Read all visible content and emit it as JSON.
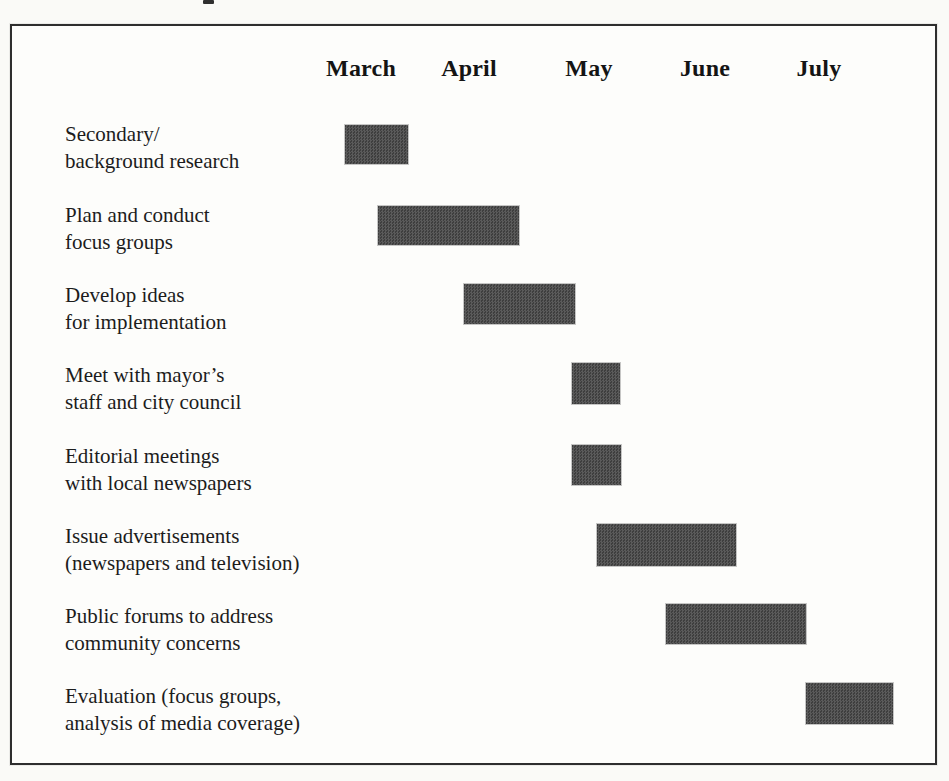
{
  "figure": {
    "background": "#fafaf7",
    "frame": {
      "left": 10,
      "top": 24,
      "width": 927,
      "height": 741,
      "border_color": "#2e2e2e",
      "fill": "#fdfdfb"
    },
    "bar_fill": "#4c4c4c",
    "scan_artifact": {
      "left": 203,
      "top": 0
    }
  },
  "chart_data": {
    "type": "gantt",
    "title": "",
    "xlabel": "",
    "ylabel": "",
    "grid": false,
    "legend": "none",
    "axis_position": "top",
    "month_scale_note": "month numbers: March=3, April=4, May=5, June=6, July=7; fractional = position within month",
    "xlim_months": [
      2.5,
      7.9
    ],
    "months": [
      {
        "label": "March",
        "month_number": 3,
        "center_px": 349
      },
      {
        "label": "April",
        "month_number": 4,
        "center_px": 457
      },
      {
        "label": "May",
        "month_number": 5,
        "center_px": 577
      },
      {
        "label": "June",
        "month_number": 6,
        "center_px": 693
      },
      {
        "label": "July",
        "month_number": 7,
        "center_px": 807
      }
    ],
    "header_top_px": 27,
    "label_left_px": 53,
    "tasks": [
      {
        "id": "secondary-background-research",
        "lines": [
          "Secondary/",
          "background research"
        ],
        "start_month": 2.85,
        "end_month": 3.45,
        "label_top_px": 95,
        "bar_px": {
          "left": 333,
          "top": 99,
          "width": 63,
          "height": 39
        }
      },
      {
        "id": "plan-conduct-focus-groups",
        "lines": [
          "Plan and conduct",
          "focus groups"
        ],
        "start_month": 3.15,
        "end_month": 4.4,
        "label_top_px": 176,
        "bar_px": {
          "left": 366,
          "top": 180,
          "width": 141,
          "height": 39
        }
      },
      {
        "id": "develop-ideas-implementation",
        "lines": [
          "Develop ideas",
          "for implementation"
        ],
        "start_month": 3.95,
        "end_month": 4.9,
        "label_top_px": 256,
        "bar_px": {
          "left": 452,
          "top": 258,
          "width": 111,
          "height": 40
        }
      },
      {
        "id": "meet-mayors-staff-city-council",
        "lines": [
          "Meet with mayor’s",
          "staff and city council"
        ],
        "start_month": 4.85,
        "end_month": 5.25,
        "label_top_px": 336,
        "bar_px": {
          "left": 560,
          "top": 337,
          "width": 48,
          "height": 41
        }
      },
      {
        "id": "editorial-meetings-local-newspapers",
        "lines": [
          "Editorial meetings",
          "with local newspapers"
        ],
        "start_month": 4.85,
        "end_month": 5.3,
        "label_top_px": 417,
        "bar_px": {
          "left": 560,
          "top": 419,
          "width": 49,
          "height": 40
        }
      },
      {
        "id": "issue-advertisements",
        "lines": [
          "Issue advertisements",
          "(newspapers and television)"
        ],
        "start_month": 5.05,
        "end_month": 6.25,
        "label_top_px": 497,
        "bar_px": {
          "left": 585,
          "top": 498,
          "width": 139,
          "height": 42
        }
      },
      {
        "id": "public-forums-community-concerns",
        "lines": [
          "Public forums to address",
          "community concerns"
        ],
        "start_month": 5.65,
        "end_month": 6.9,
        "label_top_px": 577,
        "bar_px": {
          "left": 654,
          "top": 578,
          "width": 140,
          "height": 40
        }
      },
      {
        "id": "evaluation-focus-groups-media",
        "lines": [
          "Evaluation (focus groups,",
          "analysis of media coverage)"
        ],
        "start_month": 6.9,
        "end_month": 7.65,
        "label_top_px": 657,
        "bar_px": {
          "left": 794,
          "top": 657,
          "width": 87,
          "height": 41
        }
      }
    ]
  }
}
